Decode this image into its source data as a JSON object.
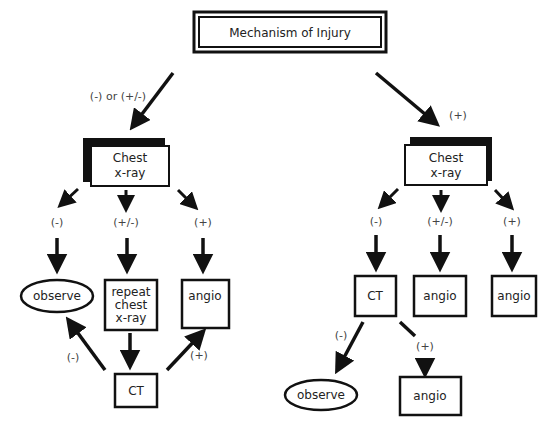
{
  "diagram": {
    "root": {
      "id": "root",
      "label": "Mechanism of Injury"
    },
    "left_branch": {
      "edge_label": "(-) or (+/-)",
      "chest_xray": {
        "id": "L_cxr",
        "lines": [
          "Chest",
          "x-ray"
        ]
      },
      "outcomes": [
        {
          "label": "(-)",
          "node": {
            "id": "L_observe",
            "shape": "ellipse",
            "lines": [
              "observe"
            ]
          }
        },
        {
          "label": "(+/-)",
          "node": {
            "id": "L_repeat",
            "shape": "rect",
            "lines": [
              "repeat",
              "chest",
              "x-ray"
            ]
          }
        },
        {
          "label": "(+)",
          "node": {
            "id": "L_angio",
            "shape": "rect",
            "lines": [
              "angio"
            ]
          }
        }
      ],
      "ct": {
        "id": "L_ct",
        "lines": [
          "CT"
        ]
      },
      "ct_edges": [
        {
          "label": "(-)",
          "to": "L_observe"
        },
        {
          "label": "(+)",
          "to": "L_angio"
        }
      ]
    },
    "right_branch": {
      "edge_label": "(+)",
      "chest_xray": {
        "id": "R_cxr",
        "lines": [
          "Chest",
          "x-ray"
        ]
      },
      "outcomes": [
        {
          "label": "(-)",
          "node": {
            "id": "R_ct",
            "shape": "rect",
            "lines": [
              "CT"
            ]
          }
        },
        {
          "label": "(+/-)",
          "node": {
            "id": "R_angio1",
            "shape": "rect",
            "lines": [
              "angio"
            ]
          }
        },
        {
          "label": "(+)",
          "node": {
            "id": "R_angio2",
            "shape": "rect",
            "lines": [
              "angio"
            ]
          }
        }
      ],
      "ct_edges": [
        {
          "label": "(-)",
          "node": {
            "id": "R_observe",
            "shape": "ellipse",
            "lines": [
              "observe"
            ]
          }
        },
        {
          "label": "(+)",
          "node": {
            "id": "R_angio3",
            "shape": "rect",
            "lines": [
              "angio"
            ]
          }
        }
      ]
    }
  }
}
